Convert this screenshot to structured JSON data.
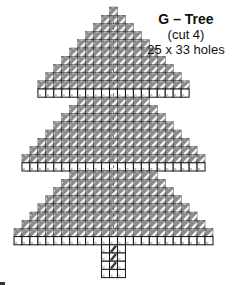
{
  "pattern": {
    "title": "G – Tree",
    "cut": "(cut 4)",
    "size": "25 x 33 holes",
    "columns": 25,
    "rows": 33,
    "cell_width": 7.96,
    "cell_height": 8.2,
    "origin_x": 14,
    "origin_y": 7,
    "colors": {
      "outline": "#111111",
      "stitch_fill": "#8a8a8a",
      "stitch_light": "#ffffff",
      "center_stitch": "#3a3a3a",
      "empty_cell": "#ffffff"
    },
    "row_spans": [
      {
        "row": 0,
        "from": 12,
        "to": 12,
        "type": "stitch"
      },
      {
        "row": 1,
        "from": 11,
        "to": 13,
        "type": "stitch"
      },
      {
        "row": 2,
        "from": 10,
        "to": 14,
        "type": "stitch"
      },
      {
        "row": 3,
        "from": 9,
        "to": 15,
        "type": "stitch"
      },
      {
        "row": 4,
        "from": 8,
        "to": 16,
        "type": "stitch"
      },
      {
        "row": 5,
        "from": 7,
        "to": 17,
        "type": "stitch"
      },
      {
        "row": 6,
        "from": 6,
        "to": 18,
        "type": "stitch"
      },
      {
        "row": 7,
        "from": 5,
        "to": 19,
        "type": "stitch"
      },
      {
        "row": 8,
        "from": 4,
        "to": 20,
        "type": "stitch"
      },
      {
        "row": 9,
        "from": 3,
        "to": 21,
        "type": "stitch"
      },
      {
        "row": 10,
        "from": 3,
        "to": 21,
        "type": "edge"
      },
      {
        "row": 11,
        "from": 8,
        "to": 16,
        "type": "stitch"
      },
      {
        "row": 12,
        "from": 7,
        "to": 17,
        "type": "stitch"
      },
      {
        "row": 13,
        "from": 6,
        "to": 18,
        "type": "stitch"
      },
      {
        "row": 14,
        "from": 5,
        "to": 19,
        "type": "stitch"
      },
      {
        "row": 15,
        "from": 4,
        "to": 20,
        "type": "stitch"
      },
      {
        "row": 16,
        "from": 3,
        "to": 21,
        "type": "stitch"
      },
      {
        "row": 17,
        "from": 2,
        "to": 22,
        "type": "stitch"
      },
      {
        "row": 18,
        "from": 1,
        "to": 23,
        "type": "stitch"
      },
      {
        "row": 19,
        "from": 1,
        "to": 23,
        "type": "edge"
      },
      {
        "row": 20,
        "from": 7,
        "to": 17,
        "type": "stitch"
      },
      {
        "row": 21,
        "from": 6,
        "to": 18,
        "type": "stitch"
      },
      {
        "row": 22,
        "from": 5,
        "to": 19,
        "type": "stitch"
      },
      {
        "row": 23,
        "from": 4,
        "to": 20,
        "type": "stitch"
      },
      {
        "row": 24,
        "from": 3,
        "to": 21,
        "type": "stitch"
      },
      {
        "row": 25,
        "from": 2,
        "to": 22,
        "type": "stitch"
      },
      {
        "row": 26,
        "from": 1,
        "to": 23,
        "type": "stitch"
      },
      {
        "row": 27,
        "from": 0,
        "to": 24,
        "type": "stitch"
      },
      {
        "row": 28,
        "from": 0,
        "to": 24,
        "type": "edge"
      },
      {
        "row": 29,
        "from": 11,
        "to": 13,
        "type": "trunk"
      },
      {
        "row": 30,
        "from": 11,
        "to": 13,
        "type": "trunk"
      },
      {
        "row": 31,
        "from": 11,
        "to": 13,
        "type": "trunk"
      },
      {
        "row": 32,
        "from": 11,
        "to": 13,
        "type": "trunk"
      }
    ]
  }
}
